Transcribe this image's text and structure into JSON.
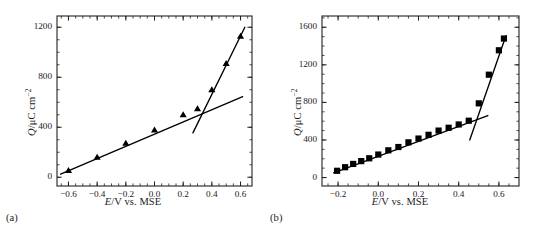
{
  "figure": {
    "panels": [
      {
        "id": "a",
        "label": "(a)",
        "xlabel_italic": "E",
        "xlabel_rest": "/V vs. MSE",
        "ylabel_italic": "Q",
        "ylabel_rest": "/μC cm",
        "ylabel_exp": "−2",
        "xticks": [
          "−0.6",
          "−0.4",
          "−0.2",
          "0.0",
          "0.2",
          "0.4",
          "0.6"
        ],
        "yticks": [
          "0",
          "400",
          "800",
          "1200"
        ]
      },
      {
        "id": "b",
        "label": "(b)",
        "xlabel_italic": "E",
        "xlabel_rest": "/V vs. MSE",
        "ylabel_italic": "Q",
        "ylabel_rest": "/μC cm",
        "ylabel_exp": "−2",
        "xticks": [
          "−0.2",
          "0.0",
          "0.2",
          "0.4",
          "0.6"
        ],
        "yticks": [
          "0",
          "400",
          "800",
          "1200",
          "1600"
        ]
      }
    ]
  },
  "chart_data": [
    {
      "type": "scatter",
      "panel": "a",
      "title": "",
      "xlabel": "E/V vs. MSE",
      "ylabel": "Q/μC cm−2",
      "xlim": [
        -0.68,
        0.68
      ],
      "ylim": [
        -70,
        1290
      ],
      "xticks": [
        -0.6,
        -0.4,
        -0.2,
        0.0,
        0.2,
        0.4,
        0.6
      ],
      "yticks": [
        0,
        400,
        800,
        1200
      ],
      "xminor_step": 0.05,
      "yminor_step": 100,
      "grid": false,
      "legend": null,
      "marker": "triangle",
      "marker_color": "#000000",
      "line_color": "#000000",
      "x": [
        -0.6,
        -0.4,
        -0.2,
        0.0,
        0.2,
        0.3,
        0.4,
        0.5,
        0.6
      ],
      "y": [
        55,
        160,
        272,
        378,
        500,
        548,
        700,
        910,
        1128
      ],
      "fit_lines": [
        {
          "name": "double-layer-fit",
          "x": [
            -0.655,
            0.615
          ],
          "y": [
            25,
            645
          ]
        },
        {
          "name": "oxide-growth-fit",
          "x": [
            0.268,
            0.63
          ],
          "y": [
            355,
            1200
          ]
        }
      ]
    },
    {
      "type": "scatter",
      "panel": "b",
      "title": "",
      "xlabel": "E/V vs. MSE",
      "ylabel": "Q/μC cm−2",
      "xlim": [
        -0.28,
        0.7
      ],
      "ylim": [
        -90,
        1720
      ],
      "xticks": [
        -0.2,
        0.0,
        0.2,
        0.4,
        0.6
      ],
      "yticks": [
        0,
        400,
        800,
        1200,
        1600
      ],
      "xminor_step": 0.05,
      "yminor_step": 100,
      "grid": false,
      "legend": null,
      "marker": "square",
      "marker_color": "#000000",
      "line_color": "#000000",
      "x": [
        -0.205,
        -0.165,
        -0.125,
        -0.085,
        -0.045,
        0.0,
        0.05,
        0.1,
        0.15,
        0.2,
        0.25,
        0.3,
        0.35,
        0.4,
        0.45,
        0.5,
        0.55,
        0.6,
        0.625
      ],
      "y": [
        72,
        110,
        145,
        175,
        205,
        245,
        290,
        325,
        375,
        415,
        455,
        500,
        530,
        565,
        605,
        790,
        1095,
        1355,
        1480
      ],
      "fit_lines": [
        {
          "name": "double-layer-fit",
          "x": [
            -0.222,
            0.545
          ],
          "y": [
            50,
            660
          ]
        },
        {
          "name": "oxide-growth-fit",
          "x": [
            0.455,
            0.635
          ],
          "y": [
            400,
            1510
          ]
        }
      ]
    }
  ]
}
